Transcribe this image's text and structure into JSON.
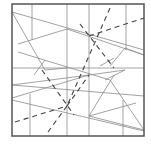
{
  "diagram": {
    "type": "crease-pattern",
    "stroke_color": "#8a8a8a",
    "border_color": "#555555",
    "dashed_color": "#444444",
    "border": {
      "x": 12,
      "y": 4,
      "w": 132,
      "h": 132
    },
    "solid_lines": [
      [
        12,
        12,
        144,
        50
      ],
      [
        32,
        4,
        32,
        40
      ],
      [
        12,
        12,
        45,
        70
      ],
      [
        18,
        44,
        67,
        29
      ],
      [
        67,
        4,
        67,
        136
      ],
      [
        89,
        4,
        89,
        136
      ],
      [
        126,
        4,
        126,
        50
      ],
      [
        67,
        29,
        144,
        55
      ],
      [
        18,
        52,
        110,
        80
      ],
      [
        12,
        68,
        144,
        68
      ],
      [
        12,
        85,
        89,
        75
      ],
      [
        12,
        85,
        144,
        96
      ],
      [
        45,
        70,
        67,
        68
      ],
      [
        34,
        75,
        45,
        60
      ],
      [
        12,
        98,
        89,
        75
      ],
      [
        30,
        94,
        30,
        136
      ],
      [
        89,
        75,
        125,
        70
      ],
      [
        89,
        116,
        144,
        130
      ],
      [
        89,
        116,
        136,
        103
      ],
      [
        105,
        80,
        125,
        70
      ],
      [
        12,
        100,
        144,
        131
      ],
      [
        89,
        116,
        114,
        75
      ],
      [
        123,
        100,
        123,
        136
      ],
      [
        110,
        80,
        144,
        130
      ],
      [
        100,
        66,
        114,
        58
      ],
      [
        110,
        66,
        125,
        48
      ],
      [
        125,
        48,
        144,
        55
      ]
    ],
    "dashed_lines": [
      [
        110,
        8,
        67,
        106
      ],
      [
        89,
        36,
        144,
        18
      ],
      [
        80,
        24,
        114,
        68
      ],
      [
        42,
        70,
        74,
        115
      ],
      [
        15,
        122,
        67,
        106
      ],
      [
        48,
        132,
        67,
        106
      ],
      [
        67,
        106,
        89,
        75
      ]
    ],
    "dashed_centers": [
      [
        89,
        36
      ],
      [
        67,
        106
      ]
    ]
  }
}
